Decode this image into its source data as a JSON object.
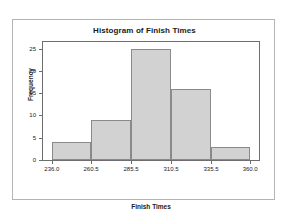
{
  "chart_data": {
    "type": "bar",
    "title": "Histogram of Finish Times",
    "xlabel": "Finish Times",
    "ylabel": "Frequency",
    "categories": [
      "236.0-260.5",
      "260.5-285.5",
      "285.5-310.5",
      "310.5-335.5",
      "335.5-360.0"
    ],
    "values": [
      4,
      9,
      25,
      16,
      3
    ],
    "bin_edges": [
      236.0,
      260.5,
      285.5,
      310.5,
      335.5,
      360.0
    ],
    "x_ticks": [
      "236.0",
      "260.5",
      "285.5",
      "310.5",
      "335.5",
      "360.0"
    ],
    "x_tick_values": [
      236.0,
      260.5,
      285.5,
      310.5,
      335.5,
      360.0
    ],
    "y_ticks": [
      "0",
      "5",
      "10",
      "15",
      "20",
      "25"
    ],
    "y_tick_values": [
      0,
      5,
      10,
      15,
      20,
      25
    ],
    "xlim": [
      230.5,
      365.5
    ],
    "ylim": [
      0,
      26.5
    ],
    "grid": false,
    "legend": false,
    "bar_fill_color": "#d2d2d2",
    "bar_border_color": "#8a8a8a",
    "axis_color": "#6e6e6e",
    "frame_color": "#b4b4b4",
    "text_color": "#1a1a1a",
    "background_color": "#ffffff"
  }
}
